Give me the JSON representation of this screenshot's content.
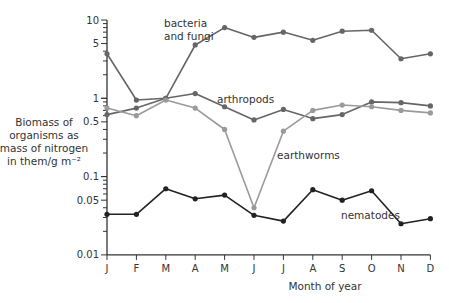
{
  "chart_data": {
    "type": "line",
    "title": "",
    "xlabel": "Month of year",
    "ylabel": "Biomass of organisms as mass of nitrogen in them/g m⁻²",
    "ylabel_lines": [
      "Biomass of",
      "organisms as",
      "mass of nitrogen",
      "in them/g m⁻²"
    ],
    "yscale": "log",
    "ylim": [
      0.01,
      10
    ],
    "grid": false,
    "legend": "inline labels",
    "categories": [
      "J",
      "F",
      "M",
      "A",
      "M",
      "J",
      "J",
      "A",
      "S",
      "O",
      "N",
      "D"
    ],
    "y_ticks": [
      {
        "value": 10,
        "label": "10"
      },
      {
        "value": 5,
        "label": "5"
      },
      {
        "value": 1,
        "label": "1"
      },
      {
        "value": 0.5,
        "label": "0.5"
      },
      {
        "value": 0.1,
        "label": "0.1"
      },
      {
        "value": 0.05,
        "label": "0.05"
      },
      {
        "value": 0.01,
        "label": "0.01"
      }
    ],
    "series": [
      {
        "name": "bacteria and fungi",
        "label_lines": [
          "bacteria",
          "and fungi"
        ],
        "color": "#666666",
        "values": [
          3.7,
          0.95,
          1.0,
          4.8,
          8.0,
          6.0,
          7.0,
          5.5,
          7.2,
          7.4,
          3.2,
          3.7
        ]
      },
      {
        "name": "arthropods",
        "label_lines": [
          "arthropods"
        ],
        "color": "#666666",
        "values": [
          0.62,
          0.75,
          1.0,
          1.15,
          0.78,
          0.53,
          0.72,
          0.55,
          0.62,
          0.9,
          0.88,
          0.8
        ]
      },
      {
        "name": "earthworms",
        "label_lines": [
          "earthworms"
        ],
        "color": "#9a9a9a",
        "values": [
          0.75,
          0.6,
          0.95,
          0.75,
          0.4,
          0.04,
          0.38,
          0.7,
          0.82,
          0.78,
          0.7,
          0.65
        ]
      },
      {
        "name": "nematodes",
        "label_lines": [
          "nematodes"
        ],
        "color": "#222222",
        "values": [
          0.033,
          0.033,
          0.07,
          0.052,
          0.058,
          0.032,
          0.027,
          0.068,
          0.05,
          0.066,
          0.025,
          0.029
        ]
      }
    ]
  }
}
